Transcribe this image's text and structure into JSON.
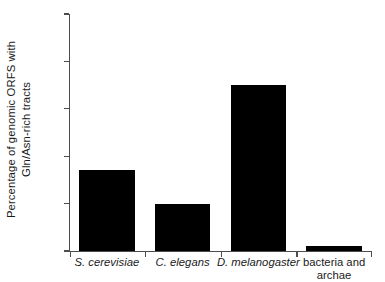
{
  "chart_data": {
    "type": "bar",
    "title": "",
    "subtitle": "",
    "xlabel": "",
    "ylabel_lines": [
      "Percentage of genomic ORFS with",
      "Gln/Asn-rich tracts"
    ],
    "ylabel": "Percentage of genomic ORFS with Gln/Asn-rich tracts",
    "categories": [
      "S. cerevisiae",
      "C. elegans",
      "D. melanogaster",
      "bacteria and archae"
    ],
    "category_lines": [
      [
        "S. cerevisiae"
      ],
      [
        "C. elegans"
      ],
      [
        "D. melanogaster"
      ],
      [
        "bacteria and",
        "archae"
      ]
    ],
    "category_italic": [
      true,
      true,
      true,
      false
    ],
    "values": [
      1.7,
      1.0,
      3.5,
      0.1
    ],
    "ylim": [
      0,
      5
    ],
    "yticks": [
      0,
      1,
      2,
      3,
      4,
      5
    ],
    "ytick_labels": [
      "0",
      "1",
      "2",
      "3",
      "4",
      "5"
    ],
    "xtick_positions": [
      0,
      1,
      2,
      3,
      4
    ],
    "grid": false,
    "legend": null,
    "bar_color": "#000000",
    "axis_color": "#4d4d4d",
    "background_color": "#ffffff"
  }
}
